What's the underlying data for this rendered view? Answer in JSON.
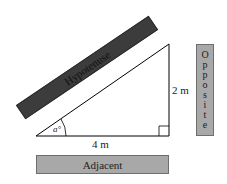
{
  "diagram": {
    "type": "right-triangle",
    "labels": {
      "hypotenuse": "Hypotenuse",
      "opposite": "Opposite",
      "opposite_letters": [
        "O",
        "p",
        "p",
        "o",
        "s",
        "i",
        "t",
        "e"
      ],
      "adjacent": "Adjacent",
      "adjacent_length": "4 m",
      "opposite_length": "2 m",
      "angle": "a°"
    },
    "colors": {
      "hypotenuse_bar": "#3c3c3c",
      "side_boxes": "#a8a8a8",
      "lines": "#000000",
      "background": "#ffffff"
    }
  }
}
